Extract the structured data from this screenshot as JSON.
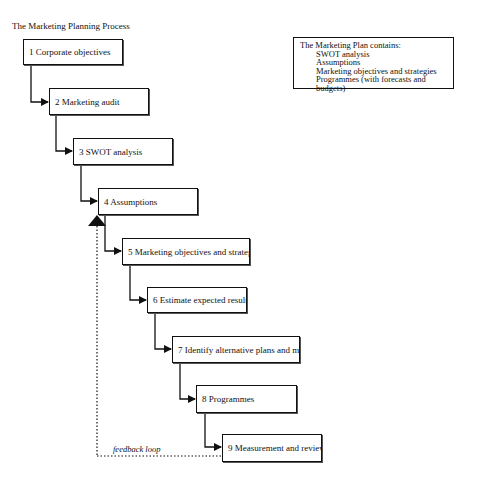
{
  "title": "The Marketing Planning Process",
  "steps": [
    {
      "label": "1  Corporate objectives"
    },
    {
      "label": "2  Marketing audit"
    },
    {
      "label": "3 SWOT analysis"
    },
    {
      "label": "4  Assumptions"
    },
    {
      "label": "5  Marketing objectives and strategies"
    },
    {
      "label": "6  Estimate expected results"
    },
    {
      "label": "7  Identify alternative plans and mixes"
    },
    {
      "label": "8  Programmes"
    },
    {
      "label": "9  Measurement and review"
    }
  ],
  "plan_box": {
    "heading": "The Marketing Plan contains:",
    "items": [
      "SWOT analysis",
      "Assumptions",
      "Marketing objectives and strategies",
      "Programmes (with forecasts and budgets)"
    ]
  },
  "feedback_label": "feedback loop"
}
